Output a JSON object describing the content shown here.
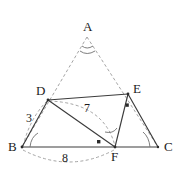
{
  "figure": {
    "type": "geometry-diagram",
    "width": 181,
    "height": 179,
    "background": "#ffffff",
    "stroke_solid": "#3c3c3c",
    "stroke_dashed": "#9a9a9a",
    "text_color": "#1b1b1b"
  },
  "vertices": [
    {
      "id": "A",
      "label": "A",
      "x": 87,
      "y": 37,
      "label_x": 83,
      "label_y": 20
    },
    {
      "id": "B",
      "label": "B",
      "x": 22,
      "y": 147,
      "label_x": 8,
      "label_y": 143
    },
    {
      "id": "C",
      "label": "C",
      "x": 158,
      "y": 147,
      "label_x": 164,
      "label_y": 143
    },
    {
      "id": "D",
      "label": "D",
      "x": 48,
      "y": 100,
      "label_x": 36,
      "label_y": 86
    },
    {
      "id": "E",
      "label": "E",
      "x": 128,
      "y": 94,
      "label_x": 133,
      "label_y": 84
    },
    {
      "id": "F",
      "label": "F",
      "x": 115,
      "y": 147,
      "label_x": 112,
      "label_y": 150
    }
  ],
  "segment_labels": [
    {
      "id": "BD",
      "text": "3",
      "x": 28,
      "y": 118
    },
    {
      "id": "DF",
      "text": "7",
      "x": 85,
      "y": 108
    },
    {
      "id": "BF",
      "text": "8",
      "x": 64,
      "y": 156
    }
  ],
  "solid_segments": [
    {
      "id": "DE",
      "from": "D",
      "to": "E"
    },
    {
      "id": "DB",
      "from": "D",
      "to": "B"
    },
    {
      "id": "DF",
      "from": "D",
      "to": "F"
    },
    {
      "id": "EF",
      "from": "E",
      "to": "F"
    },
    {
      "id": "EC",
      "from": "E",
      "to": "C"
    },
    {
      "id": "BC",
      "from": "B",
      "to": "C"
    }
  ],
  "dashed_segments": [
    {
      "id": "AB",
      "from": "A",
      "to": "B"
    },
    {
      "id": "AC",
      "from": "A",
      "to": "C"
    }
  ],
  "dashed_arcs": [
    {
      "id": "arc-BF-measure",
      "note": "arc below BC spanning B to F, labelled 8"
    },
    {
      "id": "arc-DF-measure",
      "note": "arc from D curving to F, labelled 7"
    },
    {
      "id": "arc-BD-measure",
      "note": "short arc near B-D, labelled 3"
    }
  ],
  "angle_markers": [
    {
      "id": "angle-A",
      "at": "A",
      "style": "arc"
    },
    {
      "id": "angle-B",
      "at": "B",
      "style": "arc"
    },
    {
      "id": "angle-C",
      "at": "C",
      "style": "arc"
    },
    {
      "id": "angle-F",
      "at": "F",
      "style": "arc"
    },
    {
      "id": "dot-F",
      "at": "F-interior",
      "style": "dot",
      "x": 99,
      "y": 142
    },
    {
      "id": "dot-E",
      "at": "E-interior",
      "style": "dot",
      "x": 127,
      "y": 105
    }
  ]
}
